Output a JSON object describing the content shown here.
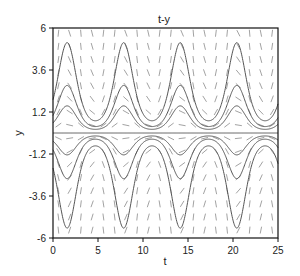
{
  "chart_data": {
    "type": "line",
    "title": "t-y",
    "xlabel": "t",
    "ylabel": "y",
    "xlim": [
      0,
      25
    ],
    "ylim": [
      -6,
      6
    ],
    "xticks": [
      0,
      5,
      10,
      15,
      20,
      25
    ],
    "xtick_labels": [
      "0",
      "5",
      "10",
      "15",
      "20",
      "25"
    ],
    "yticks": [
      6,
      3.6,
      1.2,
      -1.2,
      -3.6,
      -6
    ],
    "ytick_labels": [
      "6",
      "3.6",
      "1.2",
      "-1.2",
      "-3.6",
      "-6"
    ],
    "grid": false,
    "legend": null,
    "direction_field": {
      "equation": "dy/dt = y*cos(t)",
      "t_step": 1.25,
      "y_step": 0.75,
      "color": "#8a8a8a"
    },
    "series": [
      {
        "name": "solution y(0)=0",
        "form": "C*exp(sin t)",
        "C": 0
      },
      {
        "name": "solution C=0.57",
        "form": "C*exp(sin t)",
        "C": 0.57
      },
      {
        "name": "solution C=1.0",
        "form": "C*exp(sin t)",
        "C": 1.0
      },
      {
        "name": "solution C=1.9",
        "form": "C*exp(sin t)",
        "C": 1.9
      },
      {
        "name": "solution C=-0.46",
        "form": "C*exp(sin t)",
        "C": -0.46
      },
      {
        "name": "solution C=-0.96",
        "form": "C*exp(sin t)",
        "C": -0.96
      },
      {
        "name": "solution C=-2.0",
        "form": "C*exp(sin t)",
        "C": -2.0
      }
    ],
    "approx_extrema": {
      "peak_t": [
        1.57,
        7.85,
        14.14,
        20.42
      ],
      "trough_t": [
        4.71,
        10.99,
        17.28,
        23.56
      ],
      "upper_curve_maxima": [
        5.2,
        2.7,
        1.55
      ],
      "upper_curve_minima": [
        0.7,
        0.37,
        0.21
      ],
      "lower_curve_minima": [
        -5.5,
        -2.6,
        -1.25
      ],
      "lower_curve_maxima": [
        -0.74,
        -0.35,
        -0.17
      ]
    }
  },
  "colors": {
    "curve": "#555555",
    "frame": "#111111",
    "field": "#8a8a8a"
  }
}
